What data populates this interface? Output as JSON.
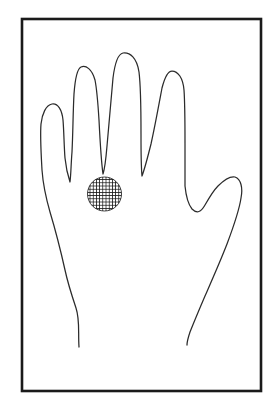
{
  "figure": {
    "view": "dorsal",
    "background_color": "#ffffff",
    "line_color": "#2b2b2b",
    "frame_color": "#1a1a1a",
    "marker_color": "#141414"
  },
  "frame": {
    "name": "border-rectangle",
    "x": 22,
    "y": 19,
    "width": 239,
    "height": 372,
    "stroke_width": 2.6
  },
  "hand": {
    "name": "hand-outline",
    "digits": [
      {
        "name": "pinky-finger",
        "tip_x": 52,
        "tip_y": 104
      },
      {
        "name": "ring-finger",
        "tip_x": 86,
        "tip_y": 67
      },
      {
        "name": "middle-finger",
        "tip_x": 127,
        "tip_y": 54
      },
      {
        "name": "index-finger",
        "tip_x": 171,
        "tip_y": 72
      },
      {
        "name": "thumb",
        "tip_x": 236,
        "tip_y": 177
      }
    ],
    "wrist": {
      "left_end_x": 79,
      "left_end_y": 347,
      "right_end_x": 187,
      "right_end_y": 345
    }
  },
  "marker": {
    "name": "hatched-region",
    "shape": "circle",
    "center_x": 104.5,
    "center_y": 194,
    "radius": 17,
    "fill_pattern": "cross-hatch",
    "hatch_spacing": 3.2,
    "color": "#141414"
  },
  "labels": {
    "caption": "",
    "legend": ""
  }
}
